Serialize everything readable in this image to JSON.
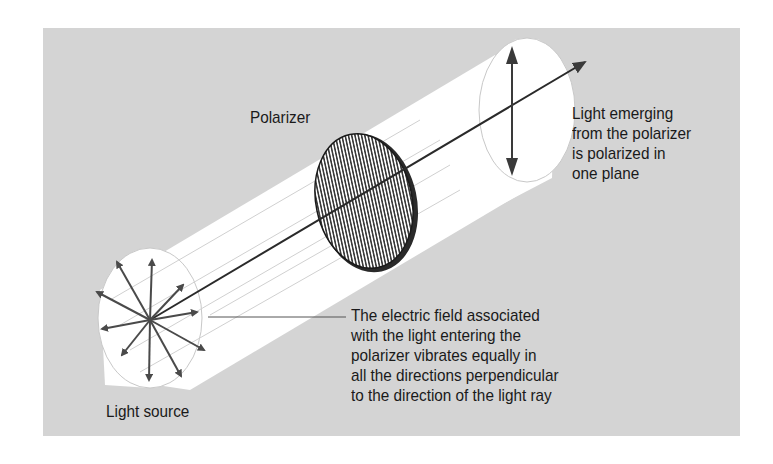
{
  "figure": {
    "labels": {
      "polarizer": "Polarizer",
      "light_source": "Light source",
      "emerging": [
        "Light emerging",
        "from the polarizer",
        "is polarized in",
        "one plane"
      ],
      "electric_field": [
        "The electric field associated",
        "with the light entering the",
        "polarizer vibrates equally in",
        "all the directions perpendicular",
        "to the direction of the light ray"
      ]
    },
    "colors": {
      "background_panel": "#d4d4d4",
      "beam_cylinder": "#ffffff",
      "polarizer_fill": "#555555",
      "arrows": "#4a4a4a",
      "text": "#1a1a1a"
    }
  }
}
